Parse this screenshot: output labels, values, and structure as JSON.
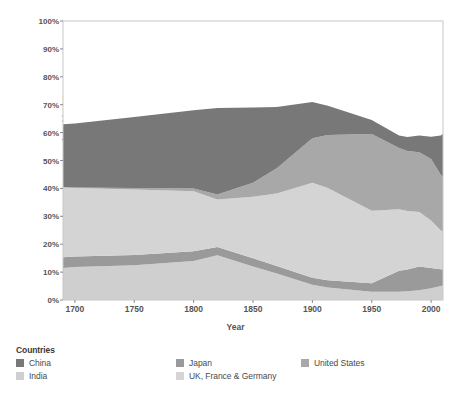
{
  "chart_data": {
    "type": "area",
    "title": "",
    "subtitle": "",
    "xlabel": "Year",
    "ylabel": "% of world GDP",
    "stacked": true,
    "grid": false,
    "legend_position": "bottom",
    "legend_title": "Countries",
    "xlim": [
      1690,
      2010
    ],
    "ylim": [
      0,
      100
    ],
    "xticks": [
      1700,
      1750,
      1800,
      1850,
      1900,
      1950,
      2000
    ],
    "xtick_labels": [
      "1700",
      "1750",
      "1800",
      "1850",
      "1900",
      "1950",
      "2000"
    ],
    "yticks": [
      0,
      10,
      20,
      30,
      40,
      50,
      60,
      70,
      80,
      90,
      100
    ],
    "ytick_labels": [
      "0%",
      "10%",
      "20%",
      "30%",
      "40%",
      "50%",
      "60%",
      "70%",
      "80%",
      "90%",
      "100%"
    ],
    "x": [
      1690,
      1700,
      1750,
      1800,
      1820,
      1850,
      1870,
      1900,
      1913,
      1950,
      1973,
      1980,
      1990,
      2000,
      2008,
      2010
    ],
    "series": [
      {
        "name": "India",
        "color": "#cfcfcf",
        "values": [
          11.5,
          11.8,
          12.5,
          14.0,
          16.0,
          12.0,
          9.5,
          5.5,
          4.5,
          3.0,
          3.0,
          3.1,
          3.5,
          4.2,
          5.0,
          5.2
        ]
      },
      {
        "name": "Japan",
        "color": "#9a9a9a",
        "values": [
          3.8,
          3.8,
          3.6,
          3.5,
          3.0,
          3.0,
          2.7,
          2.5,
          2.6,
          3.0,
          7.5,
          7.8,
          8.5,
          7.3,
          6.0,
          5.8
        ]
      },
      {
        "name": "UK, France & Germany",
        "color": "#d4d4d4",
        "values": [
          25.0,
          24.5,
          23.5,
          21.5,
          17.0,
          22.0,
          26.0,
          34.0,
          33.0,
          26.0,
          22.0,
          21.0,
          19.5,
          17.0,
          14.0,
          13.5
        ]
      },
      {
        "name": "United States",
        "color": "#a8a8a8",
        "values": [
          0.2,
          0.2,
          0.5,
          1.0,
          1.8,
          5.0,
          9.0,
          16.0,
          19.0,
          27.5,
          22.0,
          21.5,
          21.5,
          22.0,
          20.0,
          19.5
        ]
      },
      {
        "name": "China",
        "color": "#787878",
        "values": [
          22.5,
          23.0,
          25.5,
          28.0,
          31.0,
          27.0,
          22.0,
          13.0,
          10.5,
          5.0,
          4.5,
          5.0,
          6.0,
          8.0,
          14.0,
          15.5
        ]
      }
    ],
    "stack_order": [
      "India",
      "Japan",
      "UK, France & Germany",
      "United States",
      "China"
    ],
    "annotations": []
  },
  "axes": {
    "ylabel": "% of world GDP",
    "xlabel": "Year"
  },
  "legend": {
    "title": "Countries",
    "items": [
      {
        "label": "China",
        "color": "#787878",
        "col": 0,
        "row": 0
      },
      {
        "label": "India",
        "color": "#cfcfcf",
        "col": 0,
        "row": 1
      },
      {
        "label": "Japan",
        "color": "#9a9a9a",
        "col": 1,
        "row": 0
      },
      {
        "label": "UK, France & Germany",
        "color": "#d4d4d4",
        "col": 1,
        "row": 1
      },
      {
        "label": "United States",
        "color": "#a8a8a8",
        "col": 2,
        "row": 0
      }
    ]
  }
}
